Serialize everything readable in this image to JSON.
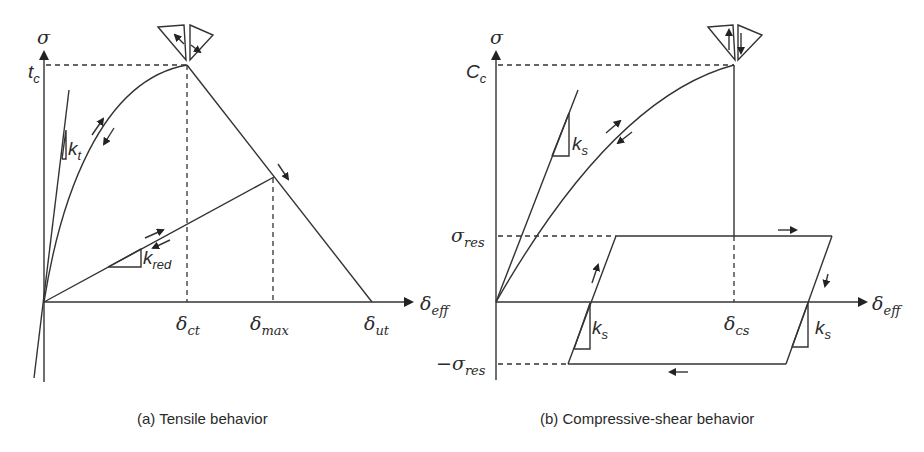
{
  "panels": [
    {
      "id": "a",
      "caption": "(a) Tensile behavior",
      "y_axis": {
        "symbol": "σ",
        "peak_label": "t",
        "peak_sub": "c"
      },
      "x_axis": {
        "symbol": "δ",
        "sub": "eff"
      },
      "x_ticks": [
        {
          "symbol": "δ",
          "sub": "ct"
        },
        {
          "symbol": "δ",
          "sub": "max"
        },
        {
          "symbol": "δ",
          "sub": "ut"
        }
      ],
      "slopes": [
        {
          "k": "k",
          "sub": "t"
        },
        {
          "k": "k",
          "sub": "red"
        }
      ]
    },
    {
      "id": "b",
      "caption": "(b) Compressive-shear behavior",
      "y_axis": {
        "symbol": "σ",
        "peak_label": "C",
        "peak_sub": "c"
      },
      "x_axis": {
        "symbol": "δ",
        "sub": "eff"
      },
      "x_ticks": [
        {
          "symbol": "δ",
          "sub": "cs"
        }
      ],
      "y_ticks": [
        {
          "symbol": "σ",
          "sub": "res"
        },
        {
          "symbol": "−σ",
          "sub": "res"
        }
      ],
      "slopes": [
        {
          "k": "k",
          "sub": "s"
        },
        {
          "k": "k",
          "sub": "s"
        },
        {
          "k": "k",
          "sub": "s"
        }
      ]
    }
  ]
}
